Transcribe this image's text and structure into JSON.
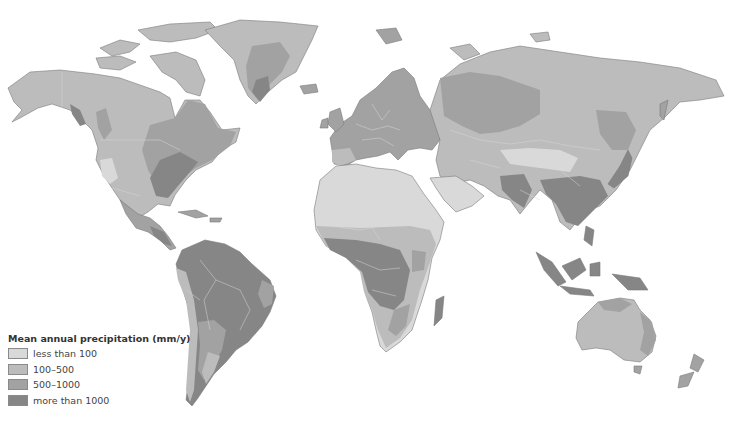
{
  "map": {
    "type": "choropleth world map",
    "subject": "Mean annual precipitation",
    "projection": "world, Pacific-excluded (Americas left, Asia/Oceania right)"
  },
  "colors": {
    "lt100": "#d9d9d9",
    "r100_500": "#bcbcbc",
    "r500_1000": "#a2a2a2",
    "gt1000": "#868686",
    "background": "#ffffff"
  },
  "legend": {
    "title": "Mean annual precipitation (mm/y)",
    "items": [
      {
        "label": "less than 100",
        "color": "#d9d9d9"
      },
      {
        "label": "100–500",
        "color": "#bcbcbc"
      },
      {
        "label": "500–1000",
        "color": "#a2a2a2"
      },
      {
        "label": "more than 1000",
        "color": "#868686"
      }
    ]
  }
}
